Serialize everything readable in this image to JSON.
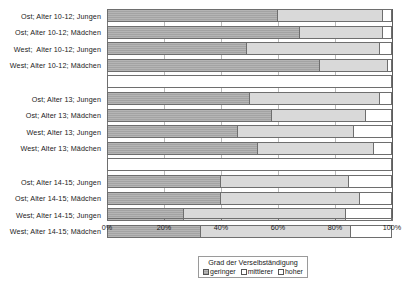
{
  "chart_data": {
    "type": "bar",
    "orientation": "horizontal",
    "stacked": true,
    "stack_mode": "percent",
    "title": "",
    "subtitle": "",
    "xlabel": "",
    "ylabel": "",
    "xlim": [
      0,
      100
    ],
    "xtick_labels": [
      "0%",
      "20%",
      "40%",
      "60%",
      "80%",
      "100%"
    ],
    "xtick_values": [
      0,
      20,
      40,
      60,
      80,
      100
    ],
    "grid": true,
    "grid_axis": "x",
    "legend_position": "bottom-right",
    "legend_title": "Grad der Verselbständigung",
    "series": [
      {
        "name": "geringer",
        "key": "low",
        "color": "#a3a3a3",
        "values": [
          60,
          68,
          49,
          75,
          50,
          58,
          46,
          53,
          40,
          40,
          27,
          33
        ]
      },
      {
        "name": "mittlerer",
        "key": "mid",
        "color": "#d9d9d9",
        "values": [
          37,
          29,
          47,
          24,
          46,
          33,
          41,
          41,
          45,
          49,
          57,
          53
        ]
      },
      {
        "name": "hoher",
        "key": "high",
        "color": "#ffffff",
        "values": [
          3,
          3,
          4,
          1,
          4,
          9,
          13,
          6,
          15,
          11,
          16,
          14
        ]
      }
    ],
    "categories": [
      "Ost; Alter 10-12; Jungen",
      "Ost; Alter 10-12; Mädchen",
      "West;  Alter 10-12; Jungen",
      "West; Alter 10-12; Mädchen",
      "Ost; Alter 13; Jungen",
      "Ost; Alter 13; Mädchen",
      "West; Alter 13; Jungen",
      "West; Alter 13; Mädchen",
      "Ost; Alter 14-15; Jungen",
      "Ost; Alter 14-15; Mädchen",
      "West; Alter 14-15; Jungen",
      "West; Alter 14-15; Mädchen"
    ],
    "groups": [
      {
        "label": "Alter 10-12",
        "bars": [
          {
            "category": "Ost; Alter 10-12; Jungen",
            "low": 60,
            "mid": 37,
            "high": 3
          },
          {
            "category": "Ost; Alter 10-12; Mädchen",
            "low": 68,
            "mid": 29,
            "high": 3
          },
          {
            "category": "West;  Alter 10-12; Jungen",
            "low": 49,
            "mid": 47,
            "high": 4
          },
          {
            "category": "West; Alter 10-12; Mädchen",
            "low": 75,
            "mid": 24,
            "high": 1
          }
        ]
      },
      {
        "label": "Alter 13",
        "bars": [
          {
            "category": "Ost; Alter 13; Jungen",
            "low": 50,
            "mid": 46,
            "high": 4
          },
          {
            "category": "Ost; Alter 13; Mädchen",
            "low": 58,
            "mid": 33,
            "high": 9
          },
          {
            "category": "West; Alter 13; Jungen",
            "low": 46,
            "mid": 41,
            "high": 13
          },
          {
            "category": "West; Alter 13; Mädchen",
            "low": 53,
            "mid": 41,
            "high": 6
          }
        ]
      },
      {
        "label": "Alter 14-15",
        "bars": [
          {
            "category": "Ost; Alter 14-15; Jungen",
            "low": 40,
            "mid": 45,
            "high": 15
          },
          {
            "category": "Ost; Alter 14-15; Mädchen",
            "low": 40,
            "mid": 49,
            "high": 11
          },
          {
            "category": "West; Alter 14-15; Jungen",
            "low": 27,
            "mid": 57,
            "high": 16
          },
          {
            "category": "West; Alter 14-15; Mädchen",
            "low": 33,
            "mid": 53,
            "high": 14
          }
        ]
      }
    ]
  },
  "legend": {
    "title": "Grad der Verselbständigung",
    "items": [
      {
        "label": "geringer",
        "swatch": "low-swatch"
      },
      {
        "label": "mittlerer",
        "swatch": "mid-swatch"
      },
      {
        "label": "hoher",
        "swatch": "high-swatch"
      }
    ]
  },
  "axis": {
    "x_ticks": [
      {
        "label": "0%",
        "value": 0
      },
      {
        "label": "20%",
        "value": 20
      },
      {
        "label": "40%",
        "value": 40
      },
      {
        "label": "60%",
        "value": 60
      },
      {
        "label": "80%",
        "value": 80
      },
      {
        "label": "100%",
        "value": 100
      }
    ]
  },
  "colors": {
    "low": "#a3a3a3",
    "mid": "#d9d9d9",
    "high": "#ffffff",
    "border": "#6e6e6e",
    "grid": "#b9b9b9",
    "text": "#1a1a1a"
  }
}
